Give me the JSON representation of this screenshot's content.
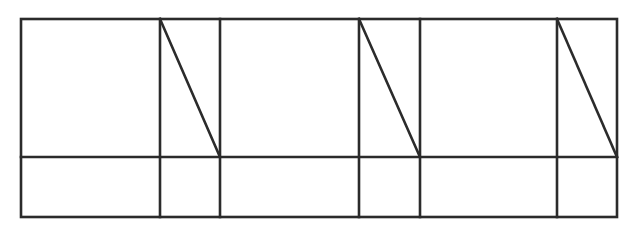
{
  "diagram": {
    "stroke_color": "#2b2b2b",
    "stroke_width": 2.6,
    "outer": {
      "x1": 21,
      "y1": 19,
      "x2": 617,
      "y2": 217
    },
    "horizontal_dividers": [
      157
    ],
    "vertical_dividers": [
      160,
      220,
      359,
      420,
      557
    ],
    "diagonals": [
      {
        "x1": 160,
        "y1": 19,
        "x2": 220,
        "y2": 157
      },
      {
        "x1": 359,
        "y1": 19,
        "x2": 420,
        "y2": 157
      },
      {
        "x1": 557,
        "y1": 19,
        "x2": 617,
        "y2": 157
      }
    ]
  }
}
